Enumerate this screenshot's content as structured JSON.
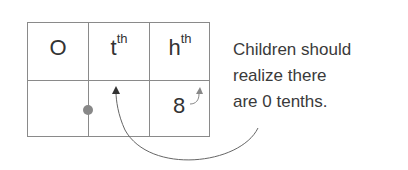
{
  "table": {
    "headers": [
      {
        "base": "O",
        "sup": ""
      },
      {
        "base": "t",
        "sup": "th"
      },
      {
        "base": "h",
        "sup": "th"
      }
    ],
    "row": [
      "",
      "",
      "8"
    ]
  },
  "note": {
    "lines": [
      "Children should",
      "realize there",
      "are 0 tenths."
    ]
  },
  "colors": {
    "grid": "#8a8a8a",
    "dot": "#888888",
    "arrow": "#555555"
  }
}
